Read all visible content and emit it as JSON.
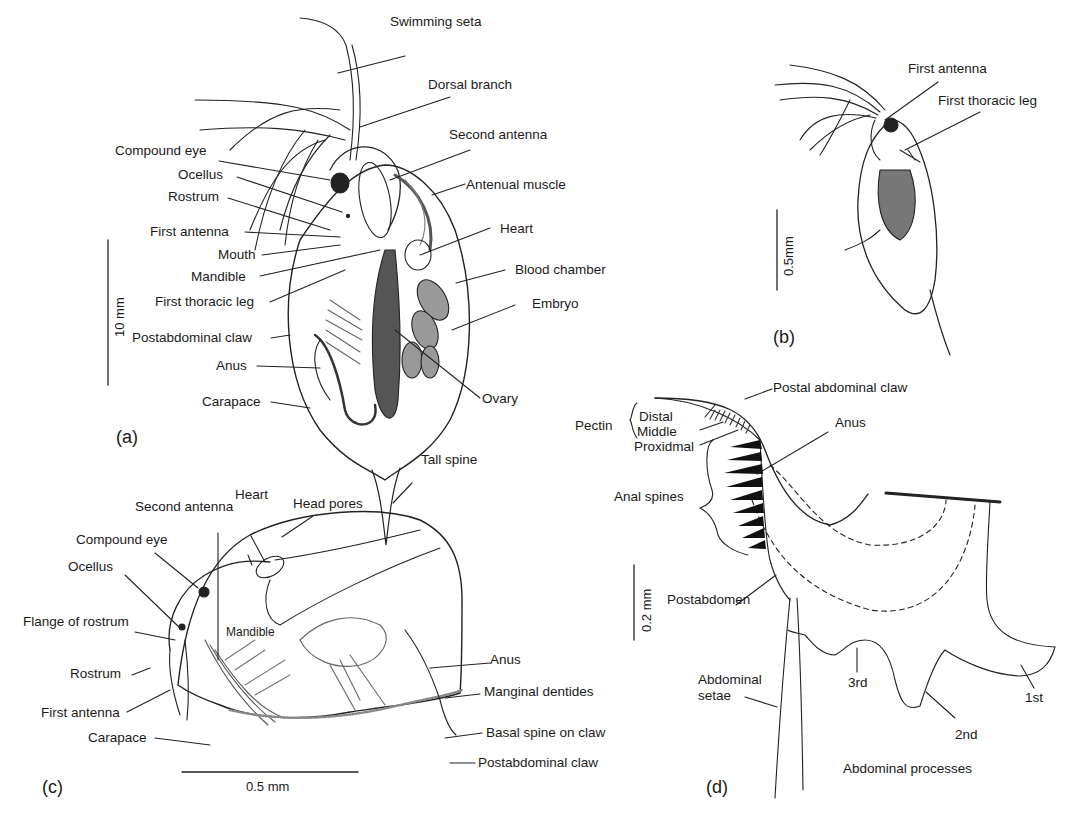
{
  "panel_a": {
    "tag": "(a)",
    "scale": "10 mm",
    "labels": {
      "swimming_seta": "Swimming seta",
      "dorsal_branch": "Dorsal branch",
      "second_antenna": "Second antenna",
      "compound_eye": "Compound eye",
      "ocellus": "Ocellus",
      "rostrum": "Rostrum",
      "antenual_muscle": "Antenual muscle",
      "first_antenna": "First antenna",
      "heart": "Heart",
      "mouth": "Mouth",
      "mandible": "Mandible",
      "blood_chamber": "Blood chamber",
      "first_thoracic_leg": "First thoracic leg",
      "embryo": "Embryo",
      "postabdominal_claw": "Postabdominal claw",
      "anus": "Anus",
      "ovary": "Ovary",
      "carapace": "Carapace",
      "tall_spine": "Tall spine"
    }
  },
  "panel_b": {
    "tag": "(b)",
    "scale": "0.5mm",
    "labels": {
      "first_antenna": "First antenna",
      "first_thoracic_leg": "First thoracic leg"
    }
  },
  "panel_c": {
    "tag": "(c)",
    "scale": "0.5 mm",
    "labels": {
      "heart": "Heart",
      "second_antenna": "Second antenna",
      "head_pores": "Head pores",
      "compound_eye": "Compound eye",
      "ocellus": "Ocellus",
      "flange_of_rostrum": "Flange of rostrum",
      "mandible": "Mandible",
      "rostrum": "Rostrum",
      "anus": "Anus",
      "manginal_dentides": "Manginal dentides",
      "first_antenna": "First antenna",
      "basal_spine_on_claw": "Basal spine on claw",
      "carapace": "Carapace",
      "postabdominal_claw": "Postabdominal claw"
    }
  },
  "panel_d": {
    "tag": "(d)",
    "scale": "0.2 mm",
    "labels": {
      "postal_abdominal_claw": "Postal abdominal claw",
      "pectin": "Pectin",
      "distal": "Distal",
      "middle": "Middle",
      "proxidmal": "Proxidmal",
      "anus": "Anus",
      "anal_spines": "Anal spines",
      "postabdomen": "Postabdomen",
      "abdominal_setae": "Abdominal\nsetae",
      "third": "3rd",
      "second": "2nd",
      "first": "1st",
      "abdominal_processes": "Abdominal processes"
    }
  }
}
